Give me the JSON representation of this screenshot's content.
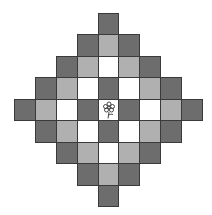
{
  "board": {
    "rows": 9,
    "cols": 9,
    "shape": "diamond",
    "colors": {
      "dark": "#6d6d6d",
      "light": "#b0b0b0",
      "white": "#ffffff",
      "border": "#3a3a3a"
    },
    "grid": [
      [
        null,
        null,
        null,
        null,
        "dark",
        null,
        null,
        null,
        null
      ],
      [
        null,
        null,
        null,
        "dark",
        "light",
        "dark",
        null,
        null,
        null
      ],
      [
        null,
        null,
        "dark",
        "light",
        "white",
        "light",
        "dark",
        null,
        null
      ],
      [
        null,
        "dark",
        "light",
        "white",
        "dark",
        "white",
        "light",
        "dark",
        null
      ],
      [
        "dark",
        "light",
        "white",
        "dark",
        "white",
        "dark",
        "white",
        "light",
        "dark"
      ],
      [
        null,
        "dark",
        "light",
        "white",
        "dark",
        "white",
        "light",
        "dark",
        null
      ],
      [
        null,
        null,
        "dark",
        "light",
        "white",
        "light",
        "dark",
        null,
        null
      ],
      [
        null,
        null,
        null,
        "dark",
        "light",
        "dark",
        null,
        null,
        null
      ],
      [
        null,
        null,
        null,
        null,
        "dark",
        null,
        null,
        null,
        null
      ]
    ],
    "center_piece": {
      "row": 4,
      "col": 4,
      "icon": "flower-icon"
    }
  }
}
